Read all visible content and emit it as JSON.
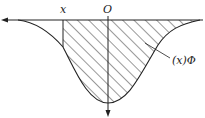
{
  "diagram": {
    "type": "normal-distribution-shaded-area (flipped)",
    "labels": {
      "x_point": "x",
      "origin": "O",
      "curve_label": "(x)Φ"
    },
    "colors": {
      "line": "#222222",
      "background": "#ffffff"
    },
    "shaded_region": "from x to +∞ under curve"
  }
}
